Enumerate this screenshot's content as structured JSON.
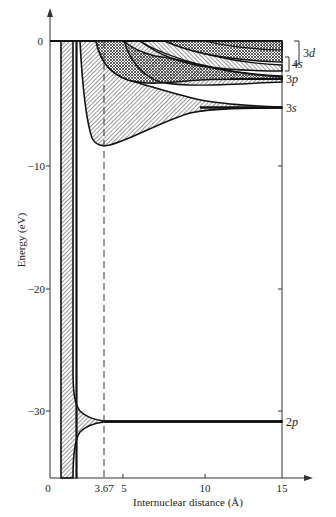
{
  "figure": {
    "type": "energy-level correlation diagram",
    "y_axis": {
      "label": "Energy (eV)",
      "ticks": [
        {
          "value": 0,
          "label": "0"
        },
        {
          "value": -10,
          "label": "−10"
        },
        {
          "value": -20,
          "label": "−20"
        },
        {
          "value": -30,
          "label": "−30"
        }
      ]
    },
    "x_axis": {
      "label": "Internuclear distance (Å)",
      "ticks": [
        {
          "value": 0,
          "label": "0"
        },
        {
          "value": 3.67,
          "label": "3.67"
        },
        {
          "value": 5,
          "label": "5"
        },
        {
          "value": 10,
          "label": "10"
        },
        {
          "value": 15,
          "label": "15"
        }
      ]
    },
    "marker_line": {
      "x": 3.67,
      "style": "dashed"
    },
    "levels": [
      {
        "name": "3d",
        "label_num": "3",
        "label_letter": "d",
        "energy_range": [
          -0.5,
          -2.5
        ]
      },
      {
        "name": "4s",
        "label_num": "4",
        "label_letter": "s",
        "energy_range": [
          -1.8,
          -2.6
        ]
      },
      {
        "name": "3p",
        "label_num": "3",
        "label_letter": "p",
        "energy": -3.0
      },
      {
        "name": "3s",
        "label_num": "3",
        "label_letter": "s",
        "energy": -5.4
      },
      {
        "name": "2p",
        "label_num": "2",
        "label_letter": "p",
        "energy": -30.9
      }
    ]
  }
}
